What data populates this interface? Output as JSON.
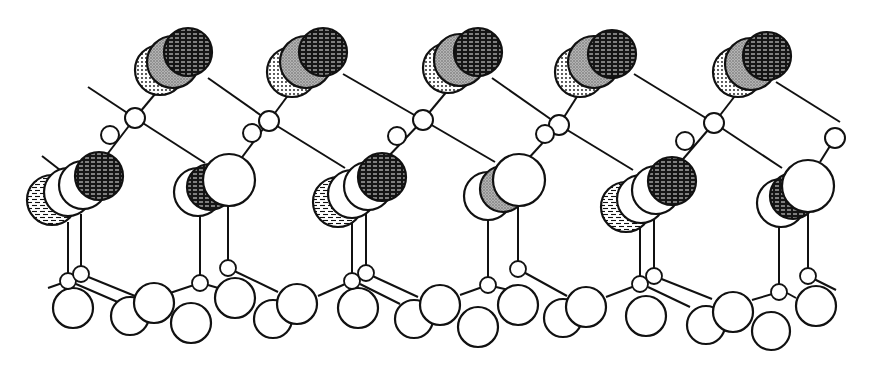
{
  "figure": {
    "type": "ball-and-stick crystal surface structure",
    "width": 869,
    "height": 368,
    "colors": {
      "stroke": "#111111",
      "background": "#ffffff",
      "grey": "#9a9a9a",
      "black": "#151515"
    },
    "top_stacks": [
      {
        "atoms": [
          {
            "cx": 160,
            "cy": 70,
            "r": 25,
            "fill": "dots"
          },
          {
            "cx": 173,
            "cy": 62,
            "r": 26,
            "fill": "grey"
          },
          {
            "cx": 188,
            "cy": 52,
            "r": 24,
            "fill": "hatch"
          }
        ]
      },
      {
        "atoms": [
          {
            "cx": 292,
            "cy": 72,
            "r": 25,
            "fill": "dots"
          },
          {
            "cx": 306,
            "cy": 62,
            "r": 26,
            "fill": "grey"
          },
          {
            "cx": 323,
            "cy": 52,
            "r": 24,
            "fill": "hatch"
          }
        ]
      },
      {
        "atoms": [
          {
            "cx": 448,
            "cy": 68,
            "r": 25,
            "fill": "dots"
          },
          {
            "cx": 460,
            "cy": 60,
            "r": 26,
            "fill": "grey"
          },
          {
            "cx": 478,
            "cy": 52,
            "r": 24,
            "fill": "hatch"
          }
        ]
      },
      {
        "atoms": [
          {
            "cx": 580,
            "cy": 72,
            "r": 25,
            "fill": "dots"
          },
          {
            "cx": 594,
            "cy": 62,
            "r": 26,
            "fill": "grey"
          },
          {
            "cx": 612,
            "cy": 54,
            "r": 24,
            "fill": "hatch"
          }
        ]
      },
      {
        "atoms": [
          {
            "cx": 738,
            "cy": 72,
            "r": 25,
            "fill": "dots"
          },
          {
            "cx": 751,
            "cy": 64,
            "r": 26,
            "fill": "grey"
          },
          {
            "cx": 767,
            "cy": 56,
            "r": 24,
            "fill": "hatch"
          }
        ]
      }
    ],
    "connector_atoms": [
      {
        "cx": 135,
        "cy": 118,
        "r": 10
      },
      {
        "cx": 269,
        "cy": 121,
        "r": 10
      },
      {
        "cx": 423,
        "cy": 120,
        "r": 10
      },
      {
        "cx": 559,
        "cy": 125,
        "r": 10
      },
      {
        "cx": 714,
        "cy": 123,
        "r": 10
      },
      {
        "cx": 110,
        "cy": 135,
        "r": 9
      },
      {
        "cx": 252,
        "cy": 133,
        "r": 9
      },
      {
        "cx": 397,
        "cy": 136,
        "r": 9
      },
      {
        "cx": 545,
        "cy": 134,
        "r": 9
      },
      {
        "cx": 685,
        "cy": 141,
        "r": 9
      },
      {
        "cx": 835,
        "cy": 138,
        "r": 10
      }
    ],
    "middle_clusters": [
      {
        "atoms": [
          {
            "cx": 52,
            "cy": 200,
            "r": 25,
            "fill": "bricks"
          },
          {
            "cx": 68,
            "cy": 192,
            "r": 24,
            "fill": "white"
          },
          {
            "cx": 83,
            "cy": 185,
            "r": 24,
            "fill": "white"
          },
          {
            "cx": 99,
            "cy": 176,
            "r": 24,
            "fill": "hatch"
          }
        ]
      },
      {
        "atoms": [
          {
            "cx": 198,
            "cy": 192,
            "r": 24,
            "fill": "white"
          },
          {
            "cx": 210,
            "cy": 187,
            "r": 23,
            "fill": "hatch"
          },
          {
            "cx": 229,
            "cy": 180,
            "r": 26,
            "fill": "white"
          }
        ]
      },
      {
        "atoms": [
          {
            "cx": 338,
            "cy": 202,
            "r": 25,
            "fill": "bricks"
          },
          {
            "cx": 352,
            "cy": 194,
            "r": 24,
            "fill": "white"
          },
          {
            "cx": 368,
            "cy": 186,
            "r": 24,
            "fill": "white"
          },
          {
            "cx": 382,
            "cy": 177,
            "r": 24,
            "fill": "hatch"
          }
        ]
      },
      {
        "atoms": [
          {
            "cx": 488,
            "cy": 196,
            "r": 24,
            "fill": "white"
          },
          {
            "cx": 503,
            "cy": 189,
            "r": 23,
            "fill": "grey"
          },
          {
            "cx": 519,
            "cy": 180,
            "r": 26,
            "fill": "white"
          }
        ]
      },
      {
        "atoms": [
          {
            "cx": 626,
            "cy": 207,
            "r": 25,
            "fill": "bricks"
          },
          {
            "cx": 641,
            "cy": 199,
            "r": 24,
            "fill": "white"
          },
          {
            "cx": 656,
            "cy": 190,
            "r": 24,
            "fill": "white"
          },
          {
            "cx": 672,
            "cy": 181,
            "r": 24,
            "fill": "hatch"
          }
        ]
      },
      {
        "atoms": [
          {
            "cx": 781,
            "cy": 203,
            "r": 24,
            "fill": "white"
          },
          {
            "cx": 793,
            "cy": 196,
            "r": 23,
            "fill": "hatch"
          },
          {
            "cx": 808,
            "cy": 186,
            "r": 26,
            "fill": "white"
          }
        ]
      }
    ],
    "small_substrate_atoms": [
      {
        "cx": 68,
        "cy": 281,
        "r": 8
      },
      {
        "cx": 81,
        "cy": 274,
        "r": 8
      },
      {
        "cx": 200,
        "cy": 283,
        "r": 8
      },
      {
        "cx": 228,
        "cy": 268,
        "r": 8
      },
      {
        "cx": 352,
        "cy": 281,
        "r": 8
      },
      {
        "cx": 366,
        "cy": 273,
        "r": 8
      },
      {
        "cx": 488,
        "cy": 285,
        "r": 8
      },
      {
        "cx": 518,
        "cy": 269,
        "r": 8
      },
      {
        "cx": 640,
        "cy": 284,
        "r": 8
      },
      {
        "cx": 654,
        "cy": 276,
        "r": 8
      },
      {
        "cx": 779,
        "cy": 292,
        "r": 8
      },
      {
        "cx": 808,
        "cy": 276,
        "r": 8
      }
    ],
    "substrate_atoms": [
      {
        "cx": 73,
        "cy": 308,
        "r": 20
      },
      {
        "cx": 130,
        "cy": 316,
        "r": 19
      },
      {
        "cx": 154,
        "cy": 303,
        "r": 20
      },
      {
        "cx": 191,
        "cy": 323,
        "r": 20
      },
      {
        "cx": 235,
        "cy": 298,
        "r": 20
      },
      {
        "cx": 273,
        "cy": 319,
        "r": 19
      },
      {
        "cx": 297,
        "cy": 304,
        "r": 20
      },
      {
        "cx": 358,
        "cy": 308,
        "r": 20
      },
      {
        "cx": 414,
        "cy": 319,
        "r": 19
      },
      {
        "cx": 440,
        "cy": 305,
        "r": 20
      },
      {
        "cx": 478,
        "cy": 327,
        "r": 20
      },
      {
        "cx": 518,
        "cy": 305,
        "r": 20
      },
      {
        "cx": 563,
        "cy": 318,
        "r": 19
      },
      {
        "cx": 586,
        "cy": 307,
        "r": 20
      },
      {
        "cx": 646,
        "cy": 316,
        "r": 20
      },
      {
        "cx": 706,
        "cy": 325,
        "r": 19
      },
      {
        "cx": 733,
        "cy": 312,
        "r": 20
      },
      {
        "cx": 771,
        "cy": 331,
        "r": 19
      },
      {
        "cx": 816,
        "cy": 306,
        "r": 20
      }
    ],
    "bonds": [
      {
        "x1": 88,
        "y1": 87,
        "x2": 135,
        "y2": 118
      },
      {
        "x1": 135,
        "y1": 118,
        "x2": 160,
        "y2": 88
      },
      {
        "x1": 135,
        "y1": 118,
        "x2": 205,
        "y2": 163
      },
      {
        "x1": 135,
        "y1": 118,
        "x2": 99,
        "y2": 165
      },
      {
        "x1": 208,
        "y1": 78,
        "x2": 269,
        "y2": 121
      },
      {
        "x1": 269,
        "y1": 121,
        "x2": 292,
        "y2": 90
      },
      {
        "x1": 269,
        "y1": 121,
        "x2": 345,
        "y2": 168
      },
      {
        "x1": 269,
        "y1": 121,
        "x2": 240,
        "y2": 160
      },
      {
        "x1": 343,
        "y1": 74,
        "x2": 423,
        "y2": 120
      },
      {
        "x1": 423,
        "y1": 120,
        "x2": 448,
        "y2": 90
      },
      {
        "x1": 423,
        "y1": 120,
        "x2": 495,
        "y2": 162
      },
      {
        "x1": 423,
        "y1": 120,
        "x2": 385,
        "y2": 160
      },
      {
        "x1": 492,
        "y1": 78,
        "x2": 559,
        "y2": 125
      },
      {
        "x1": 559,
        "y1": 125,
        "x2": 580,
        "y2": 92
      },
      {
        "x1": 559,
        "y1": 125,
        "x2": 633,
        "y2": 170
      },
      {
        "x1": 559,
        "y1": 125,
        "x2": 527,
        "y2": 160
      },
      {
        "x1": 634,
        "y1": 74,
        "x2": 714,
        "y2": 123
      },
      {
        "x1": 714,
        "y1": 123,
        "x2": 738,
        "y2": 92
      },
      {
        "x1": 714,
        "y1": 123,
        "x2": 782,
        "y2": 168
      },
      {
        "x1": 714,
        "y1": 123,
        "x2": 678,
        "y2": 165
      },
      {
        "x1": 776,
        "y1": 82,
        "x2": 840,
        "y2": 122
      },
      {
        "x1": 835,
        "y1": 138,
        "x2": 820,
        "y2": 162
      },
      {
        "x1": 42,
        "y1": 156,
        "x2": 60,
        "y2": 170
      },
      {
        "x1": 68,
        "y1": 222,
        "x2": 68,
        "y2": 281
      },
      {
        "x1": 81,
        "y1": 214,
        "x2": 81,
        "y2": 274
      },
      {
        "x1": 200,
        "y1": 215,
        "x2": 200,
        "y2": 283
      },
      {
        "x1": 228,
        "y1": 206,
        "x2": 228,
        "y2": 268
      },
      {
        "x1": 352,
        "y1": 217,
        "x2": 352,
        "y2": 281
      },
      {
        "x1": 366,
        "y1": 208,
        "x2": 366,
        "y2": 273
      },
      {
        "x1": 488,
        "y1": 219,
        "x2": 488,
        "y2": 285
      },
      {
        "x1": 518,
        "y1": 206,
        "x2": 518,
        "y2": 269
      },
      {
        "x1": 640,
        "y1": 222,
        "x2": 640,
        "y2": 284
      },
      {
        "x1": 654,
        "y1": 213,
        "x2": 654,
        "y2": 276
      },
      {
        "x1": 779,
        "y1": 226,
        "x2": 779,
        "y2": 292
      },
      {
        "x1": 808,
        "y1": 212,
        "x2": 808,
        "y2": 276
      },
      {
        "x1": 81,
        "y1": 274,
        "x2": 135,
        "y2": 296
      },
      {
        "x1": 76,
        "y1": 284,
        "x2": 120,
        "y2": 303
      },
      {
        "x1": 48,
        "y1": 288,
        "x2": 68,
        "y2": 281
      },
      {
        "x1": 170,
        "y1": 293,
        "x2": 200,
        "y2": 283
      },
      {
        "x1": 228,
        "y1": 268,
        "x2": 278,
        "y2": 292
      },
      {
        "x1": 208,
        "y1": 285,
        "x2": 232,
        "y2": 292
      },
      {
        "x1": 318,
        "y1": 296,
        "x2": 352,
        "y2": 281
      },
      {
        "x1": 366,
        "y1": 273,
        "x2": 418,
        "y2": 297
      },
      {
        "x1": 360,
        "y1": 284,
        "x2": 400,
        "y2": 304
      },
      {
        "x1": 460,
        "y1": 295,
        "x2": 488,
        "y2": 285
      },
      {
        "x1": 518,
        "y1": 269,
        "x2": 567,
        "y2": 296
      },
      {
        "x1": 496,
        "y1": 287,
        "x2": 518,
        "y2": 292
      },
      {
        "x1": 606,
        "y1": 297,
        "x2": 640,
        "y2": 284
      },
      {
        "x1": 654,
        "y1": 276,
        "x2": 712,
        "y2": 299
      },
      {
        "x1": 648,
        "y1": 287,
        "x2": 690,
        "y2": 307
      },
      {
        "x1": 752,
        "y1": 300,
        "x2": 779,
        "y2": 292
      },
      {
        "x1": 808,
        "y1": 276,
        "x2": 836,
        "y2": 290
      },
      {
        "x1": 787,
        "y1": 293,
        "x2": 796,
        "y2": 298
      }
    ]
  }
}
